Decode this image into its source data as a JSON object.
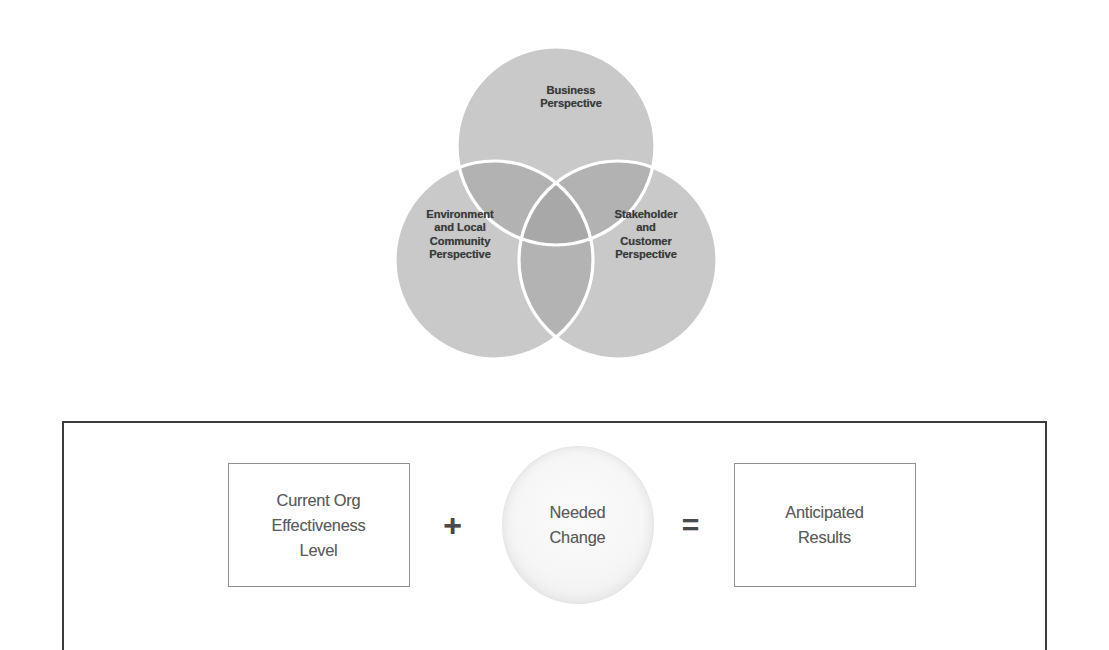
{
  "venn": {
    "title_semantic": "three-perspectives-venn",
    "circles": [
      {
        "id": "business",
        "label": "Business\nPerspective",
        "fill": "#c9c9c9",
        "position": "top"
      },
      {
        "id": "environment",
        "label": "Environment\nand Local\nCommunity\nPerspective",
        "fill": "#c9c9c9",
        "position": "bottom-left"
      },
      {
        "id": "stakeholder",
        "label": "Stakeholder\nand\nCustomer\nPerspective",
        "fill": "#c9c9c9",
        "position": "bottom-right"
      }
    ],
    "overlap_fill": "#b0b0b0",
    "center_overlap_fill": "#a6a6a6",
    "outline_color": "#ffffff"
  },
  "equation": {
    "frame_border_color": "#3c3c3c",
    "box_border_color": "#8f8f8f",
    "text_color": "#5c5c5c",
    "terms": [
      {
        "id": "current-state",
        "shape": "rectangle",
        "label": "Current Org\nEffectiveness\nLevel"
      },
      {
        "id": "needed-change",
        "shape": "circle",
        "label": "Needed\nChange"
      },
      {
        "id": "anticipated-results",
        "shape": "rectangle",
        "label": "Anticipated\nResults"
      }
    ],
    "operators": {
      "plus": "+",
      "equals": "="
    }
  }
}
